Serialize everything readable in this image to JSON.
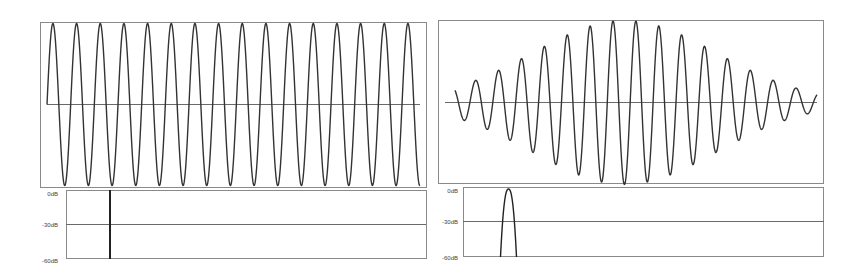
{
  "chart_data": [
    {
      "type": "line",
      "title": "",
      "description": "Continuous sine wave (constant amplitude), time domain",
      "xlabel": "",
      "ylabel": "",
      "cycles": 16,
      "amplitude": 1.0,
      "ylim": [
        -1,
        1
      ],
      "grid": false
    },
    {
      "type": "line",
      "title": "",
      "description": "Spectrum of continuous sine: single line",
      "yticks": [
        "0dB",
        "-30dB",
        "-60dB"
      ],
      "ylim": [
        -60,
        0
      ],
      "spike_position_fraction": 0.12,
      "spike_level_db": 0
    },
    {
      "type": "line",
      "title": "",
      "description": "Gaussian-windowed sine burst (wave packet), time domain",
      "xlabel": "",
      "ylabel": "",
      "cycles": 16,
      "envelope": "gaussian",
      "ylim": [
        -1,
        1
      ],
      "grid": false
    },
    {
      "type": "line",
      "title": "",
      "description": "Spectrum of windowed sine: single smooth lobe",
      "yticks": [
        "0dB",
        "-30dB",
        "-60dB"
      ],
      "ylim": [
        -60,
        0
      ],
      "lobe_center_fraction": 0.125,
      "lobe_peak_db": 0
    }
  ],
  "panels": {
    "left_spectrum": {
      "labels": [
        "0dB",
        "-30dB",
        "-60dB"
      ]
    },
    "right_spectrum": {
      "labels": [
        "0dB",
        "-30dB",
        "-60dB"
      ]
    }
  }
}
